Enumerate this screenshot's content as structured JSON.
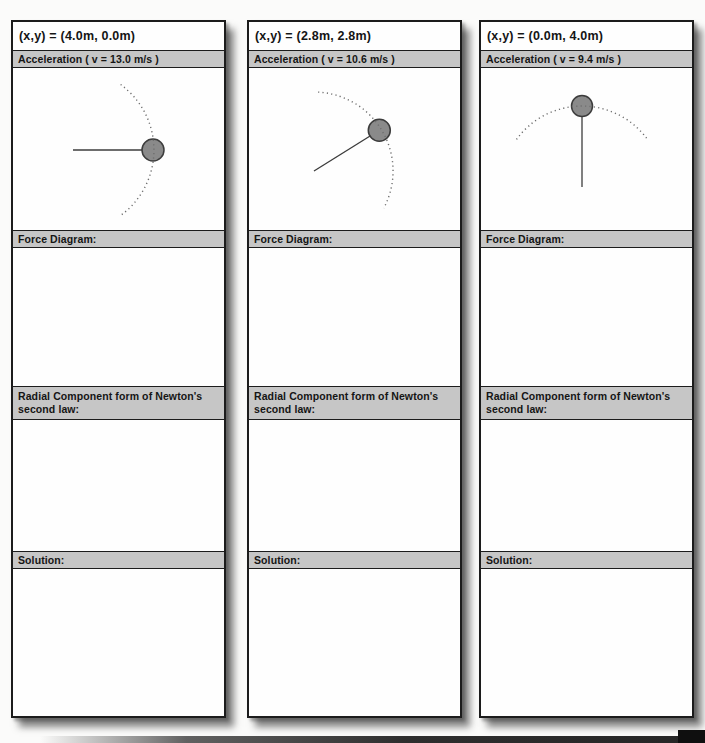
{
  "style": {
    "page_bg": "#fbfbfa",
    "bar_bg": "#c6c6c6",
    "card_border": "#1c1c1c",
    "ball_fill": "#8a8a8a",
    "ball_stroke": "#3c3c3c",
    "rod_color": "#3c3c3c",
    "arc_color": "#6e6e6e"
  },
  "columns": [
    {
      "position_label": "(x,y) = (4.0m, 0.0m)",
      "acceleration_label": "Acceleration ( v = 13.0 m/s )",
      "force_diagram_label": "Force Diagram:",
      "radial_law_label": "Radial Component form of Newton's second law:",
      "solution_label": "Solution:",
      "diagram": {
        "description": "ball on rod at 0 degrees (horizontal right), dotted circular-path arc through ball",
        "pivot": [
          60,
          82
        ],
        "rod_angle_deg": 0,
        "rod_length": 80,
        "ball_radius": 11,
        "arc_radius": 81,
        "arc_start_deg": -54,
        "arc_end_deg": 54
      }
    },
    {
      "position_label": "(x,y) = (2.8m, 2.8m)",
      "acceleration_label": "Acceleration ( v = 10.6 m/s )",
      "force_diagram_label": "Force Diagram:",
      "radial_law_label": "Radial Component form of Newton's second law:",
      "solution_label": "Solution:",
      "diagram": {
        "description": "ball on rod tilted up-right, dotted circular-path arc through ball",
        "pivot": [
          65,
          103
        ],
        "rod_angle_deg": 32,
        "rod_length": 77,
        "ball_radius": 11,
        "arc_radius": 79,
        "arc_start_deg": -28,
        "arc_end_deg": 87
      }
    },
    {
      "position_label": "(x,y) = (0.0m, 4.0m)",
      "acceleration_label": "Acceleration ( v = 9.4 m/s )",
      "force_diagram_label": "Force Diagram:",
      "radial_law_label": "Radial Component form of Newton's second law:",
      "solution_label": "Solution:",
      "diagram": {
        "description": "ball on vertical rod at top, dotted circular-path arc across the top through ball",
        "pivot": [
          101,
          119
        ],
        "rod_angle_deg": 90,
        "rod_length": 81,
        "ball_radius": 10.5,
        "arc_radius": 81,
        "arc_start_deg": 36,
        "arc_end_deg": 144
      }
    }
  ]
}
